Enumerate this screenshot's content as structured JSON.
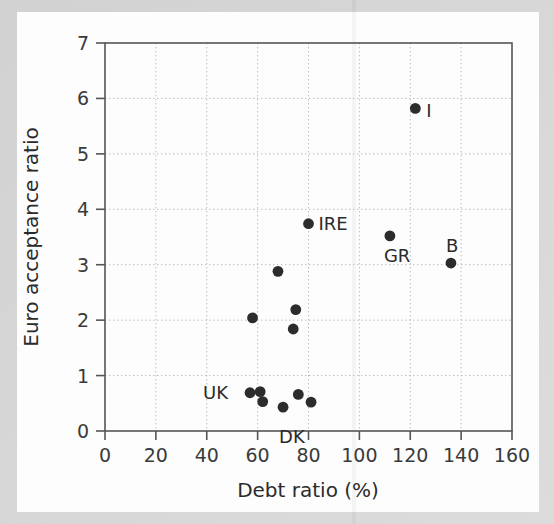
{
  "chart_data": {
    "type": "scatter",
    "title": "",
    "xlabel": "Debt ratio (%)",
    "ylabel": "Euro acceptance ratio",
    "xlim": [
      0,
      160
    ],
    "ylim": [
      0,
      7
    ],
    "xticks": [
      0,
      20,
      40,
      60,
      80,
      100,
      120,
      140,
      160
    ],
    "yticks": [
      0,
      1,
      2,
      3,
      4,
      5,
      6,
      7
    ],
    "grid": true,
    "legend": "none",
    "marker": "filled-circle",
    "marker_color": "#2c2c2c",
    "points": [
      {
        "label": "I",
        "x": 122,
        "y": 5.82,
        "label_dx": 11,
        "label_dy": 9
      },
      {
        "label": "IRE",
        "x": 80,
        "y": 3.74,
        "label_dx": 10,
        "label_dy": 6
      },
      {
        "label": "GR",
        "x": 112,
        "y": 3.52,
        "label_dx": -6,
        "label_dy": 26
      },
      {
        "label": "B",
        "x": 136,
        "y": 3.03,
        "label_dx": -5,
        "label_dy": -11
      },
      {
        "label": "",
        "x": 68,
        "y": 2.88,
        "label_dx": 0,
        "label_dy": 0
      },
      {
        "label": "",
        "x": 75,
        "y": 2.19,
        "label_dx": 0,
        "label_dy": 0
      },
      {
        "label": "",
        "x": 58,
        "y": 2.04,
        "label_dx": 0,
        "label_dy": 0
      },
      {
        "label": "",
        "x": 74,
        "y": 1.84,
        "label_dx": 0,
        "label_dy": 0
      },
      {
        "label": "UK",
        "x": 57,
        "y": 0.69,
        "label_dx": -47,
        "label_dy": 6
      },
      {
        "label": "",
        "x": 61,
        "y": 0.71,
        "label_dx": 0,
        "label_dy": 0
      },
      {
        "label": "",
        "x": 62,
        "y": 0.53,
        "label_dx": 0,
        "label_dy": 0
      },
      {
        "label": "DK",
        "x": 70,
        "y": 0.43,
        "label_dx": -4,
        "label_dy": 36
      },
      {
        "label": "",
        "x": 76,
        "y": 0.66,
        "label_dx": 0,
        "label_dy": 0
      },
      {
        "label": "",
        "x": 81,
        "y": 0.52,
        "label_dx": 0,
        "label_dy": 0
      }
    ]
  },
  "axes": {
    "x_label": "Debt ratio (%)",
    "y_label": "Euro acceptance ratio",
    "x_tick_labels": [
      "0",
      "20",
      "40",
      "60",
      "80",
      "100",
      "120",
      "140",
      "160"
    ],
    "y_tick_labels": [
      "0",
      "1",
      "2",
      "3",
      "4",
      "5",
      "6",
      "7"
    ]
  },
  "style": {
    "axis_color": "#555555",
    "grid_color": "#b9b9b9",
    "point_color": "#2c2c2c",
    "text_color": "#2b2b2b",
    "paper_color": "#fdfdfd",
    "page_color": "#d9d9d9"
  }
}
